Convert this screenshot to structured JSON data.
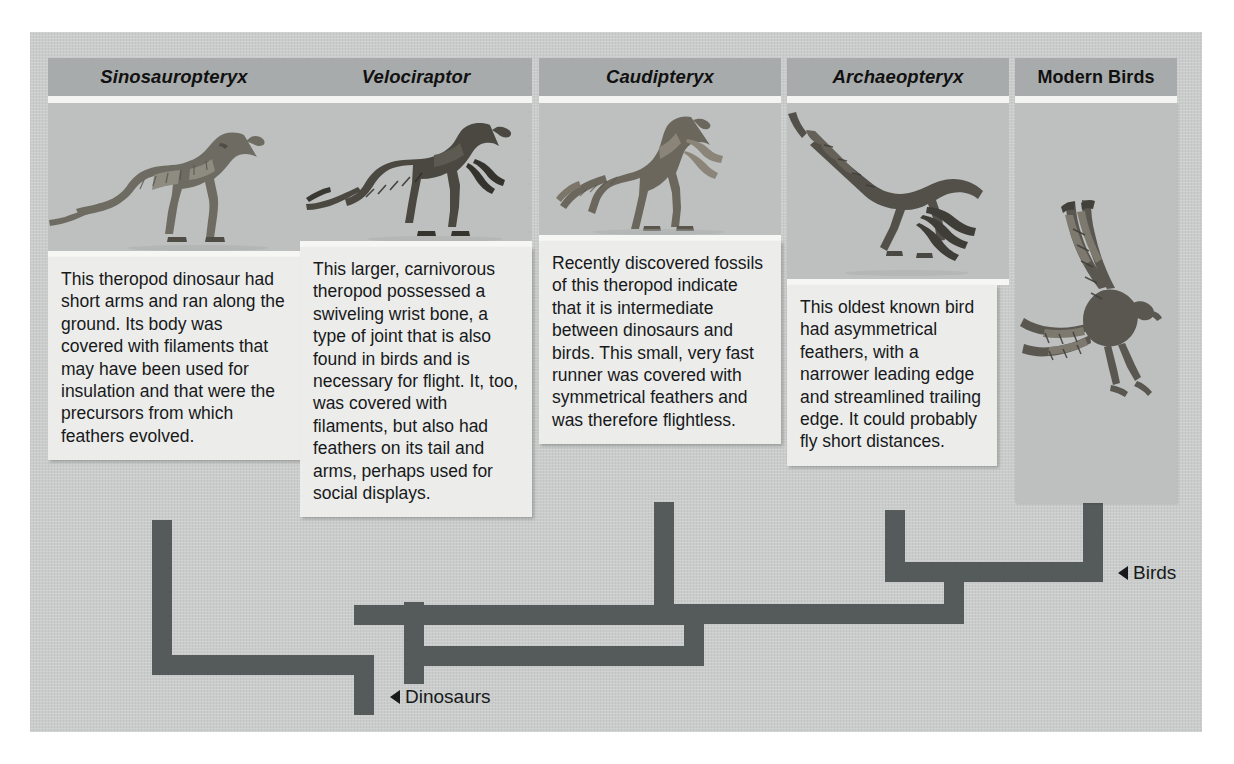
{
  "figure": {
    "kind": "cladogram-diagram",
    "background_color": "#c9cccb",
    "branch_color": "#555a5b"
  },
  "taxa": [
    {
      "id": "sinosauropteryx",
      "header": "Sinosauropteryx",
      "header_style": "italic",
      "image_name": "sinosauropteryx-illustration",
      "text": "This theropod dinosaur had short arms and ran along the ground. Its body was covered with filaments that may have been used for insulation and that were the precursors from which feathers evolved."
    },
    {
      "id": "velociraptor",
      "header": "Velociraptor",
      "header_style": "italic",
      "image_name": "velociraptor-illustration",
      "text": "This larger, carnivorous theropod possessed a swiveling wrist bone, a type of joint that is also found in birds and is necessary for flight. It, too, was covered with filaments, but also had feathers on its tail and arms, perhaps used for social displays."
    },
    {
      "id": "caudipteryx",
      "header": "Caudipteryx",
      "header_style": "italic",
      "image_name": "caudipteryx-illustration",
      "text": "Recently discovered fossils of this theropod indicate that it is intermediate between dinosaurs and birds. This small, very fast runner was covered with symmetrical feathers and was therefore flightless."
    },
    {
      "id": "archaeopteryx",
      "header": "Archaeopteryx",
      "header_style": "italic",
      "image_name": "archaeopteryx-illustration",
      "text": "This oldest known bird had asymmetrical feathers, with a narrower leading edge and streamlined trailing edge. It could probably fly short distances."
    },
    {
      "id": "modern-birds",
      "header": "Modern Birds",
      "header_style": "roman",
      "image_name": "modern-bird-illustration",
      "text": ""
    }
  ],
  "clade_labels": [
    {
      "id": "dinosaurs",
      "label": "Dinosaurs"
    },
    {
      "id": "birds",
      "label": "Birds"
    }
  ]
}
